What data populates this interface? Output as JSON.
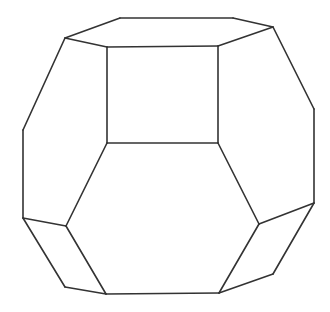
{
  "diagram": {
    "stroke_color": "#333333",
    "background": "#ffffff",
    "vertices": {
      "A": [
        120,
        18
      ],
      "B": [
        233,
        18
      ],
      "C": [
        273,
        27
      ],
      "D": [
        65,
        38
      ],
      "E": [
        107,
        47
      ],
      "F": [
        218,
        46
      ],
      "G": [
        107,
        143
      ],
      "H": [
        218,
        143
      ],
      "I": [
        23,
        130
      ],
      "J": [
        23,
        218
      ],
      "K": [
        314,
        109
      ],
      "L": [
        314,
        203
      ],
      "M": [
        66,
        226
      ],
      "N": [
        259,
        224
      ],
      "O": [
        106,
        294
      ],
      "P": [
        219,
        293
      ],
      "Q": [
        65,
        287
      ],
      "R": [
        273,
        274
      ]
    },
    "edges": [
      [
        "A",
        "B"
      ],
      [
        "B",
        "C"
      ],
      [
        "A",
        "D"
      ],
      [
        "D",
        "E"
      ],
      [
        "C",
        "F"
      ],
      [
        "E",
        "F"
      ],
      [
        "E",
        "G"
      ],
      [
        "F",
        "H"
      ],
      [
        "G",
        "H"
      ],
      [
        "D",
        "I"
      ],
      [
        "I",
        "J"
      ],
      [
        "J",
        "M"
      ],
      [
        "M",
        "G"
      ],
      [
        "C",
        "K"
      ],
      [
        "K",
        "L"
      ],
      [
        "L",
        "N"
      ],
      [
        "N",
        "H"
      ],
      [
        "M",
        "O"
      ],
      [
        "N",
        "P"
      ],
      [
        "O",
        "P"
      ],
      [
        "J",
        "Q"
      ],
      [
        "Q",
        "O"
      ],
      [
        "L",
        "R"
      ],
      [
        "R",
        "P"
      ]
    ],
    "faces": [
      {
        "name": "top-hexagon",
        "vertices": [
          "A",
          "B",
          "C",
          "F",
          "E",
          "D"
        ]
      },
      {
        "name": "front-square",
        "vertices": [
          "E",
          "F",
          "H",
          "G"
        ]
      },
      {
        "name": "front-hexagon",
        "vertices": [
          "G",
          "H",
          "N",
          "P",
          "O",
          "M"
        ]
      },
      {
        "name": "left-hexagon",
        "vertices": [
          "D",
          "E",
          "G",
          "M",
          "J",
          "I"
        ]
      },
      {
        "name": "right-hexagon",
        "vertices": [
          "C",
          "K",
          "L",
          "N",
          "H",
          "F"
        ]
      },
      {
        "name": "bottom-left-square",
        "vertices": [
          "J",
          "M",
          "O",
          "Q"
        ]
      },
      {
        "name": "bottom-right-square",
        "vertices": [
          "L",
          "R",
          "P",
          "N"
        ]
      }
    ]
  }
}
